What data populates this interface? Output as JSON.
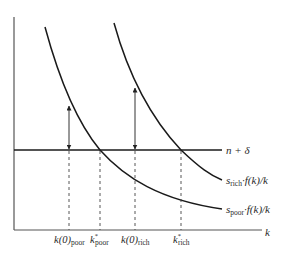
{
  "diagram": {
    "type": "solow-convergence",
    "axis": {
      "x_label": "k"
    },
    "lines": {
      "horizontal": {
        "label_main": "n + δ"
      },
      "rich_curve": {
        "label_s": "s",
        "label_sub": "rich",
        "label_rest": "·f(k)/k"
      },
      "poor_curve": {
        "label_s": "s",
        "label_sub": "poor",
        "label_rest": "·f(k)/k"
      }
    },
    "tick_labels": [
      {
        "main": "k(0)",
        "sub": "poor",
        "sup": ""
      },
      {
        "main": "k",
        "sub": "poor",
        "sup": "*"
      },
      {
        "main": "k(0)",
        "sub": "rich",
        "sup": ""
      },
      {
        "main": "k",
        "sub": "rich",
        "sup": "*"
      }
    ],
    "colors": {
      "curve": "#1a1a1a",
      "axis": "#555555",
      "arrow": "#333333",
      "dashed": "#444444"
    }
  }
}
